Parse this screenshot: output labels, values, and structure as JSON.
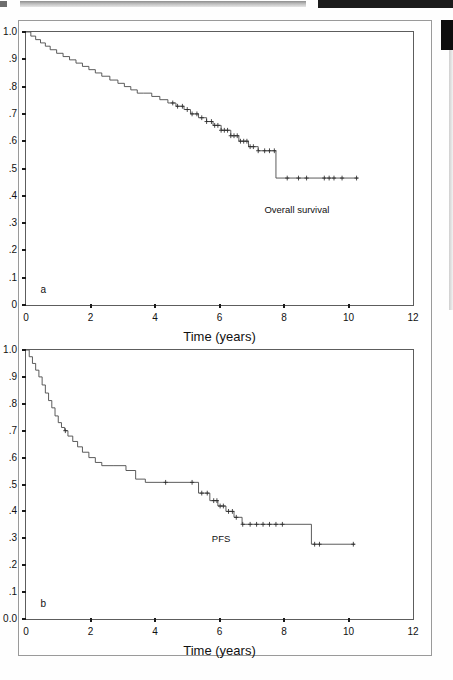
{
  "figure": {
    "panels": [
      {
        "id": "a",
        "letter": "a",
        "curve_label": "Overall survival",
        "x_axis_title": "Time (years)",
        "y_ticks": [
          "1.0",
          ".9",
          ".8",
          ".7",
          ".6",
          ".5",
          ".4",
          ".3",
          ".2",
          ".1",
          "0"
        ],
        "x_ticks": [
          "0",
          "2",
          "4",
          "6",
          "8",
          "10",
          "12"
        ]
      },
      {
        "id": "b",
        "letter": "b",
        "curve_label": "PFS",
        "x_axis_title": "Time (years)",
        "y_ticks": [
          "1.0",
          ".9",
          ".8",
          ".7",
          ".6",
          ".5",
          ".4",
          ".3",
          ".2",
          ".1",
          "0.0"
        ],
        "x_ticks": [
          "0",
          "2",
          "4",
          "6",
          "8",
          "10",
          "12"
        ]
      }
    ]
  },
  "chart_data": [
    {
      "type": "line",
      "title": "Overall survival",
      "panel": "a",
      "xlabel": "Time (years)",
      "ylabel": "",
      "xlim": [
        0,
        12
      ],
      "ylim": [
        0,
        1.0
      ],
      "xticks": [
        0,
        2,
        4,
        6,
        8,
        10,
        12
      ],
      "yticks": [
        0,
        0.1,
        0.2,
        0.3,
        0.4,
        0.5,
        0.6,
        0.7,
        0.8,
        0.9,
        1.0
      ],
      "grid": false,
      "legend": "none",
      "style": "kaplan-meier step curve with censor tick marks",
      "series": [
        {
          "name": "Overall survival",
          "x": [
            0.0,
            0.15,
            0.3,
            0.45,
            0.6,
            0.75,
            0.95,
            1.15,
            1.35,
            1.55,
            1.75,
            1.95,
            2.15,
            2.35,
            2.6,
            2.85,
            3.05,
            3.25,
            3.45,
            3.65,
            3.9,
            4.15,
            4.4,
            4.65,
            4.9,
            5.1,
            5.35,
            5.6,
            5.8,
            6.05,
            6.35,
            6.6,
            6.9,
            7.2,
            7.55,
            7.75,
            10.3
          ],
          "y": [
            1.0,
            0.985,
            0.972,
            0.96,
            0.948,
            0.935,
            0.922,
            0.91,
            0.898,
            0.886,
            0.874,
            0.862,
            0.85,
            0.838,
            0.824,
            0.812,
            0.8,
            0.788,
            0.776,
            0.776,
            0.764,
            0.752,
            0.74,
            0.728,
            0.716,
            0.7,
            0.686,
            0.672,
            0.658,
            0.64,
            0.62,
            0.6,
            0.58,
            0.565,
            0.565,
            0.465,
            0.465
          ]
        }
      ],
      "censor_marks_x": [
        4.55,
        4.7,
        4.85,
        5.0,
        5.15,
        5.3,
        5.45,
        5.6,
        5.75,
        5.85,
        5.95,
        6.05,
        6.15,
        6.25,
        6.35,
        6.45,
        6.55,
        6.65,
        6.75,
        6.85,
        6.95,
        7.05,
        7.2,
        7.4,
        7.55,
        7.7,
        8.1,
        8.45,
        8.7,
        9.25,
        9.4,
        9.55,
        9.8,
        10.25
      ],
      "annotations": [
        {
          "text": "Overall survival",
          "x": 8.4,
          "y": 0.35
        },
        {
          "text": "a",
          "x": 0.45,
          "y": 0.06
        }
      ]
    },
    {
      "type": "line",
      "title": "PFS",
      "panel": "b",
      "xlabel": "Time (years)",
      "ylabel": "",
      "xlim": [
        0,
        12
      ],
      "ylim": [
        0,
        1.0
      ],
      "xticks": [
        0,
        2,
        4,
        6,
        8,
        10,
        12
      ],
      "yticks": [
        0,
        0.1,
        0.2,
        0.3,
        0.4,
        0.5,
        0.6,
        0.7,
        0.8,
        0.9,
        1.0
      ],
      "grid": false,
      "legend": "none",
      "style": "kaplan-meier step curve with censor tick marks",
      "series": [
        {
          "name": "Progression free survival",
          "x": [
            0.0,
            0.1,
            0.2,
            0.3,
            0.4,
            0.5,
            0.6,
            0.7,
            0.8,
            0.9,
            1.0,
            1.1,
            1.2,
            1.3,
            1.45,
            1.6,
            1.75,
            1.95,
            2.15,
            2.35,
            2.7,
            3.1,
            3.4,
            3.7,
            4.35,
            5.35,
            5.7,
            5.95,
            6.2,
            6.45,
            6.7,
            8.85,
            10.2
          ],
          "y": [
            1.0,
            0.975,
            0.95,
            0.925,
            0.9,
            0.87,
            0.84,
            0.812,
            0.785,
            0.755,
            0.73,
            0.712,
            0.7,
            0.68,
            0.66,
            0.64,
            0.62,
            0.6,
            0.582,
            0.57,
            0.57,
            0.552,
            0.52,
            0.508,
            0.508,
            0.468,
            0.44,
            0.42,
            0.4,
            0.378,
            0.352,
            0.278,
            0.278
          ]
        }
      ],
      "censor_marks_x": [
        1.22,
        4.33,
        5.15,
        5.45,
        5.62,
        5.82,
        5.92,
        6.02,
        6.12,
        6.28,
        6.4,
        6.52,
        6.72,
        6.95,
        7.15,
        7.35,
        7.55,
        7.75,
        7.95,
        8.95,
        9.1,
        10.15
      ],
      "annotations": [
        {
          "text": "PFS",
          "x": 6.05,
          "y": 0.3
        },
        {
          "text": "b",
          "x": 0.45,
          "y": 0.06
        }
      ]
    }
  ]
}
